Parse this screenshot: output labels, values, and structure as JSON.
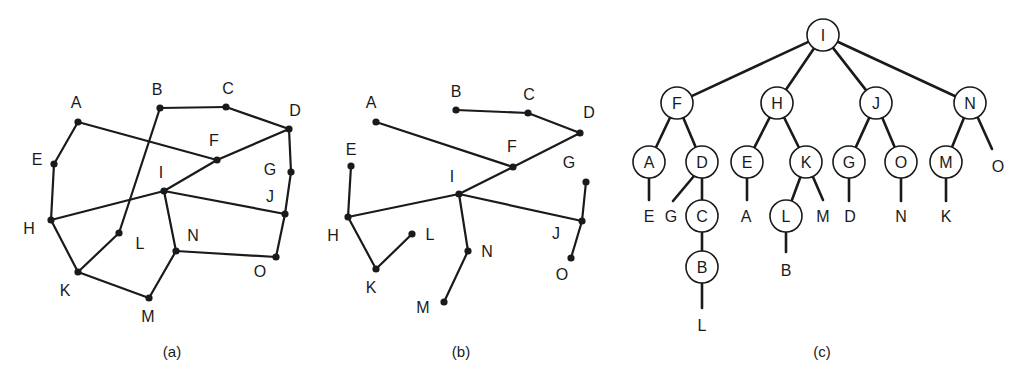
{
  "figures": [
    {
      "id": "a",
      "caption": "(a)",
      "caption_pos": [
        172,
        357
      ],
      "description": "Undirected graph with 15 vertices",
      "nodes": [
        {
          "name": "A",
          "x": 78,
          "y": 122,
          "lx": 76,
          "ly": 108
        },
        {
          "name": "B",
          "x": 160,
          "y": 108,
          "lx": 157,
          "ly": 95
        },
        {
          "name": "C",
          "x": 226,
          "y": 107,
          "lx": 228,
          "ly": 94
        },
        {
          "name": "D",
          "x": 289,
          "y": 129,
          "lx": 295,
          "ly": 116
        },
        {
          "name": "E",
          "x": 54,
          "y": 164,
          "lx": 37,
          "ly": 165
        },
        {
          "name": "F",
          "x": 217,
          "y": 160,
          "lx": 214,
          "ly": 146
        },
        {
          "name": "G",
          "x": 291,
          "y": 172,
          "lx": 270,
          "ly": 175
        },
        {
          "name": "H",
          "x": 51,
          "y": 220,
          "lx": 29,
          "ly": 234
        },
        {
          "name": "I",
          "x": 164,
          "y": 191,
          "lx": 161,
          "ly": 178
        },
        {
          "name": "J",
          "x": 285,
          "y": 214,
          "lx": 270,
          "ly": 202
        },
        {
          "name": "K",
          "x": 78,
          "y": 272,
          "lx": 65,
          "ly": 296
        },
        {
          "name": "L",
          "x": 119,
          "y": 233,
          "lx": 140,
          "ly": 249
        },
        {
          "name": "M",
          "x": 149,
          "y": 298,
          "lx": 148,
          "ly": 322
        },
        {
          "name": "N",
          "x": 176,
          "y": 251,
          "lx": 193,
          "ly": 241
        },
        {
          "name": "O",
          "x": 276,
          "y": 257,
          "lx": 260,
          "ly": 277
        }
      ],
      "edges": [
        [
          "A",
          "E"
        ],
        [
          "E",
          "H"
        ],
        [
          "A",
          "F"
        ],
        [
          "B",
          "C"
        ],
        [
          "C",
          "D"
        ],
        [
          "B",
          "L"
        ],
        [
          "D",
          "F"
        ],
        [
          "F",
          "I"
        ],
        [
          "D",
          "G"
        ],
        [
          "G",
          "J"
        ],
        [
          "H",
          "I"
        ],
        [
          "I",
          "J"
        ],
        [
          "I",
          "N"
        ],
        [
          "J",
          "O"
        ],
        [
          "N",
          "O"
        ],
        [
          "H",
          "K"
        ],
        [
          "K",
          "L"
        ],
        [
          "K",
          "M"
        ],
        [
          "M",
          "N"
        ]
      ]
    },
    {
      "id": "b",
      "caption": "(b)",
      "caption_pos": [
        461,
        357
      ],
      "description": "Spanning tree of graph (a)",
      "nodes": [
        {
          "name": "A",
          "x": 376,
          "y": 122,
          "lx": 371,
          "ly": 108
        },
        {
          "name": "B",
          "x": 456,
          "y": 110,
          "lx": 456,
          "ly": 97
        },
        {
          "name": "C",
          "x": 528,
          "y": 113,
          "lx": 529,
          "ly": 100
        },
        {
          "name": "D",
          "x": 580,
          "y": 133,
          "lx": 589,
          "ly": 118
        },
        {
          "name": "E",
          "x": 351,
          "y": 166,
          "lx": 351,
          "ly": 155
        },
        {
          "name": "F",
          "x": 513,
          "y": 167,
          "lx": 512,
          "ly": 152
        },
        {
          "name": "G",
          "x": 586,
          "y": 182,
          "lx": 569,
          "ly": 168
        },
        {
          "name": "H",
          "x": 348,
          "y": 217,
          "lx": 333,
          "ly": 241
        },
        {
          "name": "I",
          "x": 459,
          "y": 194,
          "lx": 452,
          "ly": 182
        },
        {
          "name": "J",
          "x": 582,
          "y": 221,
          "lx": 556,
          "ly": 239
        },
        {
          "name": "K",
          "x": 376,
          "y": 269,
          "lx": 371,
          "ly": 293
        },
        {
          "name": "L",
          "x": 412,
          "y": 234,
          "lx": 430,
          "ly": 240
        },
        {
          "name": "M",
          "x": 444,
          "y": 302,
          "lx": 423,
          "ly": 313
        },
        {
          "name": "N",
          "x": 468,
          "y": 251,
          "lx": 487,
          "ly": 257
        },
        {
          "name": "O",
          "x": 571,
          "y": 258,
          "lx": 562,
          "ly": 280
        }
      ],
      "edges": [
        [
          "B",
          "C"
        ],
        [
          "C",
          "D"
        ],
        [
          "D",
          "F"
        ],
        [
          "A",
          "F"
        ],
        [
          "F",
          "I"
        ],
        [
          "I",
          "H"
        ],
        [
          "H",
          "E"
        ],
        [
          "H",
          "K"
        ],
        [
          "K",
          "L"
        ],
        [
          "I",
          "N"
        ],
        [
          "N",
          "M"
        ],
        [
          "I",
          "J"
        ],
        [
          "J",
          "G"
        ],
        [
          "J",
          "O"
        ]
      ]
    },
    {
      "id": "c",
      "caption": "(c)",
      "caption_pos": [
        822,
        357
      ],
      "description": "Rooted tree drawn from root I",
      "circles": [
        {
          "name": "I",
          "x": 823,
          "y": 35
        },
        {
          "name": "F",
          "x": 677,
          "y": 103
        },
        {
          "name": "H",
          "x": 777,
          "y": 103
        },
        {
          "name": "J",
          "x": 876,
          "y": 103
        },
        {
          "name": "N",
          "x": 970,
          "y": 103
        },
        {
          "name": "A",
          "x": 649,
          "y": 162
        },
        {
          "name": "D",
          "x": 702,
          "y": 162
        },
        {
          "name": "E",
          "x": 747,
          "y": 162
        },
        {
          "name": "K",
          "x": 806,
          "y": 162
        },
        {
          "name": "G",
          "x": 849,
          "y": 162
        },
        {
          "name": "O",
          "x": 901,
          "y": 162
        },
        {
          "name": "M",
          "x": 946,
          "y": 162
        },
        {
          "name": "C",
          "x": 702,
          "y": 216
        },
        {
          "name": "B",
          "x": 702,
          "y": 267
        },
        {
          "name": "L",
          "x": 786,
          "y": 216
        }
      ],
      "leaves": [
        {
          "name": "E",
          "x": 649,
          "y": 216,
          "px": 649,
          "py": 178,
          "ex": 649,
          "ey": 200
        },
        {
          "name": "G",
          "x": 671,
          "y": 216,
          "px": 694,
          "py": 176,
          "ex": 673,
          "ey": 201
        },
        {
          "name": "A",
          "x": 746,
          "y": 216,
          "px": 747,
          "py": 178,
          "ex": 747,
          "ey": 200
        },
        {
          "name": "M",
          "x": 823,
          "y": 216,
          "px": 813,
          "py": 177,
          "ex": 823,
          "ey": 200
        },
        {
          "name": "D",
          "x": 850,
          "y": 216,
          "px": 849,
          "py": 178,
          "ex": 849,
          "ey": 201
        },
        {
          "name": "N",
          "x": 901,
          "y": 216,
          "px": 901,
          "py": 178,
          "ex": 901,
          "ey": 201
        },
        {
          "name": "K",
          "x": 946,
          "y": 216,
          "px": 946,
          "py": 178,
          "ex": 946,
          "ey": 201
        },
        {
          "name": "O",
          "x": 998,
          "y": 166,
          "px": 978,
          "py": 118,
          "ex": 992,
          "ey": 149
        },
        {
          "name": "B",
          "x": 786,
          "y": 270,
          "px": 786,
          "py": 232,
          "ex": 786,
          "ey": 252
        },
        {
          "name": "L",
          "x": 702,
          "y": 325,
          "px": 702,
          "py": 283,
          "ex": 702,
          "ey": 308
        }
      ],
      "edges": [
        [
          "I",
          "F"
        ],
        [
          "I",
          "H"
        ],
        [
          "I",
          "J"
        ],
        [
          "I",
          "N"
        ],
        [
          "F",
          "A"
        ],
        [
          "F",
          "D"
        ],
        [
          "H",
          "E"
        ],
        [
          "H",
          "K"
        ],
        [
          "J",
          "G"
        ],
        [
          "J",
          "O"
        ],
        [
          "N",
          "M"
        ],
        [
          "D",
          "C"
        ],
        [
          "C",
          "B"
        ],
        [
          "K",
          "L"
        ]
      ]
    }
  ],
  "colors": {
    "ink": "#1a1a1a",
    "background": "#ffffff"
  }
}
